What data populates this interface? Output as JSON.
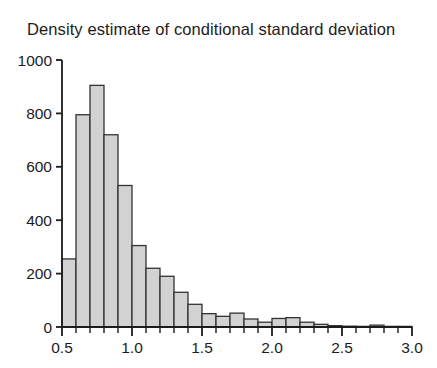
{
  "chart_data": {
    "type": "bar",
    "title": "Density estimate of conditional standard deviation",
    "xlabel": "",
    "ylabel": "",
    "grid": false,
    "legend": null,
    "bin_width": 0.1,
    "xlim": [
      0.5,
      3.0
    ],
    "ylim": [
      0,
      1000
    ],
    "x_major_ticks": [
      0.5,
      1.0,
      1.5,
      2.0,
      2.5,
      3.0
    ],
    "x_tick_labels": [
      "0.5",
      "1.0",
      "1.5",
      "2.0",
      "2.5",
      "3.0"
    ],
    "x_minor_tick_step": 0.1,
    "y_ticks": [
      0,
      200,
      400,
      600,
      800,
      1000
    ],
    "y_tick_labels": [
      "0",
      "200",
      "400",
      "600",
      "800",
      "1000"
    ],
    "bin_starts": [
      0.5,
      0.6,
      0.7,
      0.8,
      0.9,
      1.0,
      1.1,
      1.2,
      1.3,
      1.4,
      1.5,
      1.6,
      1.7,
      1.8,
      1.9,
      2.0,
      2.1,
      2.2,
      2.3,
      2.4,
      2.5,
      2.6,
      2.7,
      2.8,
      2.9
    ],
    "categories": [
      "0.5-0.6",
      "0.6-0.7",
      "0.7-0.8",
      "0.8-0.9",
      "0.9-1.0",
      "1.0-1.1",
      "1.1-1.2",
      "1.2-1.3",
      "1.3-1.4",
      "1.4-1.5",
      "1.5-1.6",
      "1.6-1.7",
      "1.7-1.8",
      "1.8-1.9",
      "1.9-2.0",
      "2.0-2.1",
      "2.1-2.2",
      "2.2-2.3",
      "2.3-2.4",
      "2.4-2.5",
      "2.5-2.6",
      "2.6-2.7",
      "2.7-2.8",
      "2.8-2.9",
      "2.9-3.0"
    ],
    "values": [
      255,
      795,
      905,
      720,
      530,
      305,
      220,
      190,
      130,
      85,
      50,
      40,
      52,
      30,
      18,
      32,
      35,
      18,
      10,
      5,
      3,
      2,
      7,
      2,
      1
    ],
    "bar_fill_color": "#d2d2d2",
    "bar_edge_color": "#333333",
    "axis_color": "#1c1c1c",
    "background_color": "#ffffff"
  }
}
